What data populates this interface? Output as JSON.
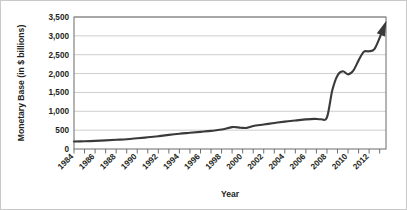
{
  "chart_data": {
    "type": "line",
    "title": "",
    "xlabel": "Year",
    "ylabel": "Monetary Base (in $ billions)",
    "xlim": [
      1984,
      2013.6
    ],
    "ylim": [
      0,
      3500
    ],
    "grid": true,
    "legend_position": "none",
    "y_ticks": [
      0,
      500,
      1000,
      1500,
      2000,
      2500,
      3000,
      3500
    ],
    "y_tick_labels": [
      "0",
      "500",
      "1,000",
      "1,500",
      "2,000",
      "2,500",
      "3,000",
      "3,500"
    ],
    "x_tick_labels": [
      "1984",
      "1986",
      "1988",
      "1990",
      "1992",
      "1994",
      "1996",
      "1998",
      "2000",
      "2002",
      "2004",
      "2006",
      "2008",
      "2010",
      "2012"
    ],
    "x_tick_values": [
      1984,
      1986,
      1988,
      1990,
      1992,
      1994,
      1996,
      1998,
      2000,
      2002,
      2004,
      2006,
      2008,
      2010,
      2012
    ],
    "x_minor_tick_values": [
      1984,
      1985,
      1986,
      1987,
      1988,
      1989,
      1990,
      1991,
      1992,
      1993,
      1994,
      1995,
      1996,
      1997,
      1998,
      1999,
      2000,
      2001,
      2002,
      2003,
      2004,
      2005,
      2006,
      2007,
      2008,
      2009,
      2010,
      2011,
      2012,
      2013
    ],
    "arrow_end": true,
    "series": [
      {
        "name": "Monetary Base",
        "color": "#3a3a3a",
        "x": [
          1984,
          1985,
          1986,
          1987,
          1988,
          1989,
          1990,
          1991,
          1992,
          1993,
          1994,
          1995,
          1996,
          1997,
          1998,
          1999,
          1999.8,
          2000.4,
          2001,
          2002,
          2003,
          2004,
          2005,
          2006,
          2006.8,
          2007.4,
          2008,
          2008.5,
          2009,
          2009.5,
          2010,
          2010.5,
          2011,
          2011.5,
          2012,
          2012.5,
          2013,
          2013.5
        ],
        "values": [
          200,
          205,
          215,
          230,
          245,
          260,
          285,
          310,
          340,
          375,
          405,
          430,
          455,
          480,
          515,
          580,
          565,
          560,
          610,
          650,
          690,
          725,
          755,
          785,
          800,
          790,
          840,
          1550,
          1950,
          2060,
          1980,
          2080,
          2350,
          2580,
          2590,
          2650,
          2950,
          3300
        ]
      }
    ]
  },
  "axis": {
    "y_title": "Monetary Base (in $ billions)",
    "x_title": "Year"
  }
}
